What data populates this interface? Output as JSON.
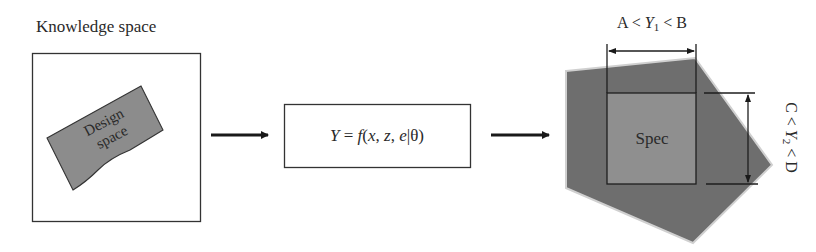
{
  "knowledge_space": {
    "title": "Knowledge space",
    "design_space": {
      "line1": "Design",
      "line2": "space"
    }
  },
  "model": {
    "lhs": "Y",
    "eq": " = ",
    "func": "f",
    "args_open": "(",
    "x": "x",
    "sep1": ", ",
    "z": "z",
    "sep2": ", ",
    "e": "e",
    "bar": "|",
    "theta": "θ",
    "args_close": ")"
  },
  "output_space": {
    "spec_label": "Spec",
    "y1_constraint": {
      "lower": "A",
      "lt1": " < ",
      "var": "Y",
      "sub": "1",
      "lt2": " < ",
      "upper": "B"
    },
    "y2_constraint": {
      "lower": "C",
      "lt1": " < ",
      "var": "Y",
      "sub": "2",
      "lt2": " < ",
      "upper": "D"
    }
  },
  "colors": {
    "design_space_fill": "#8c8c8c",
    "output_region_fill": "#6e6e6e",
    "spec_fill": "#8f8f8f",
    "stroke": "#2a2a2a"
  }
}
